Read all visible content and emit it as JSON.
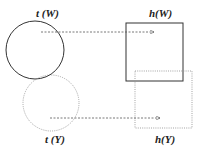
{
  "diagram": {
    "nodes": [
      {
        "id": "tW",
        "shape": "circle",
        "style": "solid",
        "label": "t (W)"
      },
      {
        "id": "tY",
        "shape": "circle",
        "style": "dotted",
        "label": "t (Y)"
      },
      {
        "id": "hW",
        "shape": "square",
        "style": "solid",
        "label": "h(W)"
      },
      {
        "id": "hY",
        "shape": "square",
        "style": "dotted",
        "label": "h(Y)"
      }
    ],
    "edges": [
      {
        "from": "tW",
        "to": "hW",
        "style": "dashed-arrow"
      },
      {
        "from": "tY",
        "to": "hY",
        "style": "dashed-arrow"
      }
    ],
    "colors": {
      "solid": "#333333",
      "dotted": "#888888",
      "arrow": "#555555"
    }
  }
}
